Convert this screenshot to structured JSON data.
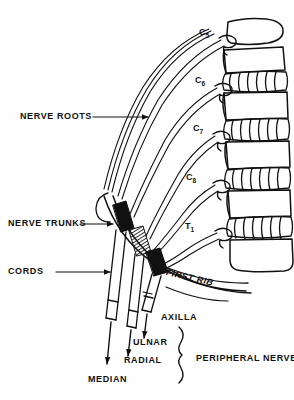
{
  "figure": {
    "ink_color": "#111111",
    "background_color": "#fefefe"
  },
  "labels": {
    "nerve_roots": "NERVE ROOTS",
    "nerve_trunks": "NERVE TRUNKS",
    "cords": "CORDS",
    "first_rib": "FIRST RIB",
    "axilla": "AXILLA",
    "peripheral_nerves": "PERIPHERAL NERVES"
  },
  "nerve_roots": [
    {
      "letter": "C",
      "number": "5"
    },
    {
      "letter": "C",
      "number": "6"
    },
    {
      "letter": "C",
      "number": "7"
    },
    {
      "letter": "C",
      "number": "8"
    },
    {
      "letter": "T",
      "number": "1"
    }
  ],
  "peripheral_nerves": [
    {
      "name": "ULNAR"
    },
    {
      "name": "RADIAL"
    },
    {
      "name": "MEDIAN"
    }
  ],
  "icons": {
    "leader_arrow": "arrow-icon",
    "brace": "curly-brace-icon",
    "vertebra": "vertebra-icon",
    "disc": "intervertebral-disc-icon"
  }
}
